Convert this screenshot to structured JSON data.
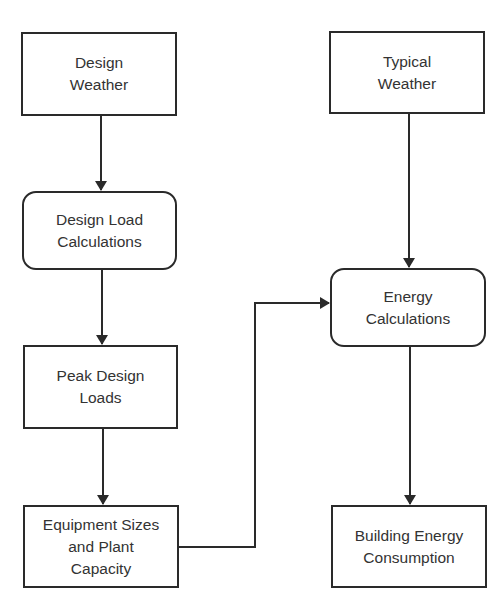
{
  "diagram": {
    "type": "flowchart",
    "nodes": [
      {
        "id": "design_weather",
        "label": "Design\nWeather",
        "shape": "rectangle"
      },
      {
        "id": "design_load_calc",
        "label": "Design Load\nCalculations",
        "shape": "rounded-rectangle"
      },
      {
        "id": "peak_design_loads",
        "label": "Peak Design\nLoads",
        "shape": "rectangle"
      },
      {
        "id": "equipment_sizes",
        "label": "Equipment Sizes\nand Plant\nCapacity",
        "shape": "rectangle"
      },
      {
        "id": "typical_weather",
        "label": "Typical\nWeather",
        "shape": "rectangle"
      },
      {
        "id": "energy_calc",
        "label": "Energy\nCalculations",
        "shape": "rounded-rectangle"
      },
      {
        "id": "building_energy",
        "label": "Building Energy\nConsumption",
        "shape": "rectangle"
      }
    ],
    "edges": [
      {
        "from": "design_weather",
        "to": "design_load_calc"
      },
      {
        "from": "design_load_calc",
        "to": "peak_design_loads"
      },
      {
        "from": "peak_design_loads",
        "to": "equipment_sizes"
      },
      {
        "from": "equipment_sizes",
        "to": "energy_calc"
      },
      {
        "from": "typical_weather",
        "to": "energy_calc"
      },
      {
        "from": "energy_calc",
        "to": "building_energy"
      }
    ],
    "colors": {
      "stroke": "#2a2a2a",
      "text": "#333333",
      "background": "#ffffff"
    }
  }
}
